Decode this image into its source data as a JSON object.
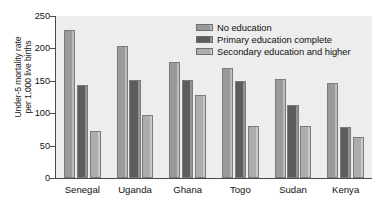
{
  "chart_data": {
    "type": "bar",
    "title": "",
    "subtitle": "",
    "xlabel": "",
    "ylabel": "Under-5 mortality rate per 1,000 live births",
    "ylabel_lines": [
      "Under-5 mortality rate",
      "per 1,000 live births"
    ],
    "categories": [
      "Senegal",
      "Uganda",
      "Ghana",
      "Togo",
      "Sudan",
      "Kenya"
    ],
    "series": [
      {
        "name": "No education",
        "values": [
          228,
          203,
          179,
          170,
          153,
          146
        ]
      },
      {
        "name": "Primary education complete",
        "values": [
          144,
          152,
          152,
          149,
          112,
          79
        ]
      },
      {
        "name": "Secondary education and higher",
        "values": [
          73,
          97,
          128,
          80,
          80,
          64
        ]
      }
    ],
    "ylim": [
      0,
      250
    ],
    "yticks": [
      0,
      50,
      100,
      150,
      200,
      250
    ],
    "ytick_labels": [
      "0",
      "50",
      "100",
      "150",
      "200",
      "250"
    ],
    "grid": false,
    "legend_position": "top-right",
    "colors": {
      "series_0": "#9a9a9a",
      "series_1": "#5d5d5d",
      "series_2": "#adadad",
      "plot_background": "#ededed",
      "axis": "#4a4a4a",
      "text": "#111111",
      "page_background": "#ffffff"
    }
  }
}
